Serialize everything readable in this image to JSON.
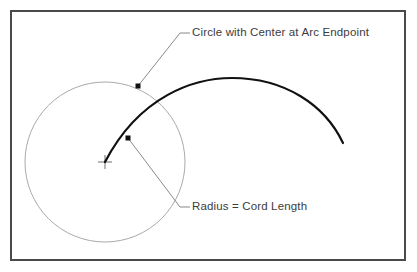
{
  "figure": {
    "background_color": "#ffffff",
    "border": {
      "name": "outer-frame",
      "color": "#4a4a4a",
      "width_px": 2,
      "x": 11,
      "y": 11,
      "width": 394,
      "height": 249
    }
  },
  "annotations": {
    "top_label": {
      "text": "Circle with Center at Arc Endpoint",
      "color": "#3c3c3c",
      "x": 192,
      "y": 33,
      "leader": {
        "color": "#8a8a8a",
        "points": "138,86 180,33 190,33"
      },
      "marker": {
        "name": "arc-endpoint-marker",
        "shape": "square",
        "color": "#111111",
        "x": 138,
        "y": 86,
        "size": 5
      }
    },
    "bottom_label": {
      "text": "Radius = Cord Length",
      "color": "#3c3c3c",
      "x": 192,
      "y": 207,
      "leader": {
        "color": "#8a8a8a",
        "points": "128,138 180,207 190,207"
      },
      "marker": {
        "name": "cord-midpoint-marker",
        "shape": "square",
        "color": "#111111",
        "x": 128,
        "y": 138,
        "size": 5
      }
    }
  },
  "geometry": {
    "circle": {
      "name": "construction-circle",
      "center_x": 105,
      "center_y": 162,
      "radius": 80,
      "stroke_color": "#a9a9a9",
      "stroke_width": 1,
      "fill": "none"
    },
    "arc": {
      "name": "construction-arc",
      "stroke_color": "#111111",
      "stroke_width": 2.2,
      "fill": "none",
      "start_x": 105,
      "start_y": 162,
      "apex_x": 232,
      "apex_y": 78,
      "end_x": 343,
      "end_y": 143,
      "path": "M 105 162 C 140 95 195 78 232 78 C 285 78 325 105 343 143"
    },
    "center_marker": {
      "name": "circle-center-crosshair",
      "x": 105,
      "y": 162,
      "arm_length": 7,
      "stroke_color": "#6e6e6e",
      "stroke_width": 1
    }
  }
}
